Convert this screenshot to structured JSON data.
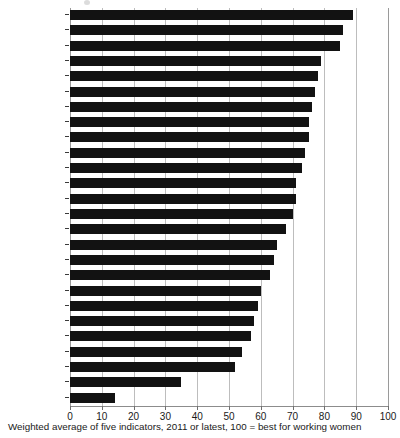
{
  "caption": "Weighted average of five indicators, 2011 or latest, 100 = best for working women",
  "axis": {
    "ticks": [
      "0",
      "10",
      "20",
      "30",
      "40",
      "50",
      "60",
      "70",
      "80",
      "90",
      "100"
    ]
  },
  "chart_data": {
    "type": "bar",
    "orientation": "horizontal",
    "title": "",
    "subtitle": "",
    "xlabel": "",
    "ylabel": "",
    "xlim": [
      0,
      100
    ],
    "grid": true,
    "legend": false,
    "bar_color": "#121212",
    "note": "Weighted average of five indicators, 2011 or latest, 100 = best for working women",
    "categories": [
      "New Zealand",
      "Norway",
      "Sweden",
      "Canada",
      "Australia",
      "Spain",
      "Finland",
      "Portugal",
      "Poland",
      "Denmark",
      "France",
      "United States",
      "Belgium",
      "Hungary",
      "Ireland",
      "Slovakia",
      "Israel",
      "Britain",
      "Austria",
      "Germany",
      "Greece",
      "Italy",
      "Czech Republic",
      "Switzerland",
      "Japan",
      "South Korea"
    ],
    "values": [
      89,
      86,
      85,
      79,
      78,
      77,
      76,
      75,
      75,
      74,
      73,
      71,
      71,
      70,
      68,
      65,
      64,
      63,
      60,
      59,
      58,
      57,
      54,
      52,
      35,
      14
    ]
  }
}
